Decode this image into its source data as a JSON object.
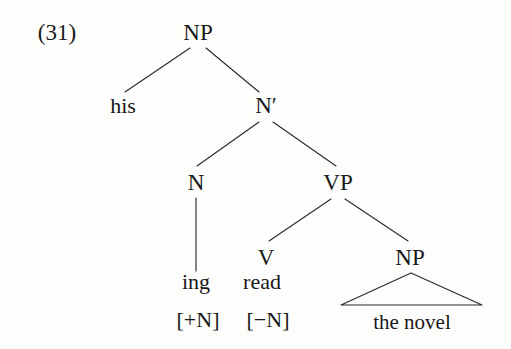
{
  "figure": {
    "example_number": "(31)",
    "background_color": "#fdfdfc",
    "ink_color": "#181818",
    "line_color": "#2b2b2b"
  },
  "tree": {
    "nodes": {
      "root_np": {
        "label": "NP",
        "x": 198,
        "y": 40
      },
      "spec_his": {
        "label": "his",
        "x": 123,
        "y": 113
      },
      "nbar": {
        "label": "N′",
        "x": 266,
        "y": 113
      },
      "head_n": {
        "label": "N",
        "x": 196,
        "y": 190
      },
      "vp": {
        "label": "VP",
        "x": 338,
        "y": 190
      },
      "v": {
        "label": "V",
        "x": 266,
        "y": 265
      },
      "obj_np": {
        "label": "NP",
        "x": 410,
        "y": 265
      }
    },
    "terminals": {
      "ing": {
        "label": "ing",
        "x": 196,
        "y": 289
      },
      "read": {
        "label": "read",
        "x": 262,
        "y": 289
      },
      "the_novel": {
        "label": "the novel",
        "x": 412,
        "y": 329
      }
    },
    "features": {
      "ing_feature": {
        "label": "[+N]",
        "x": 198,
        "y": 327
      },
      "read_feature": {
        "label": "[−N]",
        "x": 268,
        "y": 327
      }
    },
    "edges": [
      {
        "name": "np-to-his",
        "x1": 190,
        "y1": 48,
        "x2": 125,
        "y2": 92
      },
      {
        "name": "np-to-nbar",
        "x1": 206,
        "y1": 48,
        "x2": 259,
        "y2": 92
      },
      {
        "name": "nbar-to-n",
        "x1": 259,
        "y1": 122,
        "x2": 197,
        "y2": 166
      },
      {
        "name": "nbar-to-vp",
        "x1": 273,
        "y1": 122,
        "x2": 336,
        "y2": 166
      },
      {
        "name": "n-to-ing",
        "x1": 196,
        "y1": 198,
        "x2": 196,
        "y2": 271
      },
      {
        "name": "vp-to-v",
        "x1": 331,
        "y1": 199,
        "x2": 269,
        "y2": 241
      },
      {
        "name": "vp-to-np",
        "x1": 345,
        "y1": 199,
        "x2": 408,
        "y2": 241
      }
    ],
    "triangle": {
      "name": "np-triangle",
      "apex_x": 411,
      "apex_y": 273,
      "left_x": 341,
      "right_x": 482,
      "base_y": 305
    }
  }
}
